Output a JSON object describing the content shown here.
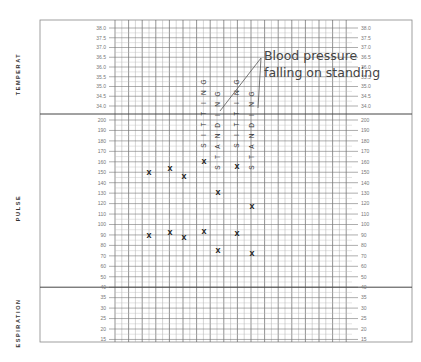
{
  "chart_data": {
    "type": "scatter",
    "sections": [
      {
        "name": "temperature",
        "label": "TEMPERAT",
        "range": [
          34.0,
          38.0
        ],
        "ticks": [
          38.0,
          37.5,
          37.0,
          36.5,
          36.0,
          35.5,
          35.0,
          34.5,
          34.0
        ]
      },
      {
        "name": "pulse",
        "label": "PULSE",
        "range": [
          40,
          200
        ],
        "ticks": [
          200,
          190,
          180,
          170,
          160,
          150,
          140,
          130,
          120,
          110,
          100,
          90,
          80,
          70,
          60,
          50,
          40
        ]
      },
      {
        "name": "respiration",
        "label": "ESPIRATION",
        "range": [
          15,
          35
        ],
        "ticks": [
          35,
          30,
          25,
          20,
          15
        ]
      }
    ],
    "tick_labels": {
      "temperature": [
        "38.0",
        "37.5",
        "37.0",
        "36.5",
        "36.0",
        "35.5",
        "35.0",
        "34.5",
        "34.0"
      ],
      "pulse": [
        "200",
        "190",
        "180",
        "170",
        "160",
        "150",
        "140",
        "130",
        "120",
        "110",
        "100",
        "90",
        "80",
        "70",
        "60",
        "50",
        "40"
      ],
      "respiration": [
        "35",
        "30",
        "25",
        "20",
        "15"
      ]
    },
    "series": [
      {
        "name": "upper reading",
        "marker": "x",
        "x": [
          1,
          2,
          3,
          4,
          5,
          6,
          7
        ],
        "values": [
          150,
          154,
          146,
          161,
          131,
          156,
          118
        ]
      },
      {
        "name": "lower reading",
        "marker": "x",
        "x": [
          1,
          2,
          3,
          4,
          5,
          6,
          7
        ],
        "values": [
          90,
          93,
          88,
          94,
          76,
          92,
          73
        ]
      }
    ],
    "position_labels": [
      {
        "text": "SITTING",
        "column": 4
      },
      {
        "text": "STANDING",
        "column": 5
      },
      {
        "text": "SITTING",
        "column": 6
      },
      {
        "text": "STANDING",
        "column": 7
      }
    ],
    "annotation": {
      "line1": "Blood pressure",
      "line2": "falling on standing"
    },
    "grid": true
  }
}
